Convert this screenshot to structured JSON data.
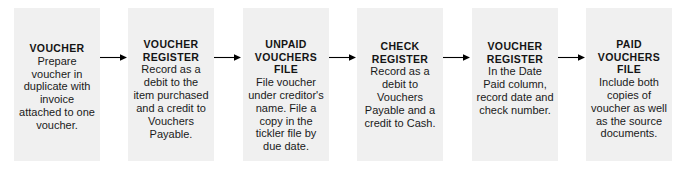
{
  "diagram": {
    "box_color": "#f0f0f0",
    "arrow_color": "#000000",
    "text_color": "#141414",
    "nodes": [
      {
        "id": "voucher",
        "title": "VOUCHER",
        "body": "Prepare voucher in duplicate with invoice attached to one voucher."
      },
      {
        "id": "voucher-register-1",
        "title": "VOUCHER REGISTER",
        "body": "Record as a debit to the item purchased and a credit to Vouchers Payable."
      },
      {
        "id": "unpaid-vouchers-file",
        "title": "UNPAID VOUCHERS FILE",
        "body": "File voucher under creditor's name. File a copy in the tickler file by due date."
      },
      {
        "id": "check-register",
        "title": "CHECK REGISTER",
        "body": "Record as a debit to Vouchers Payable and a credit to Cash."
      },
      {
        "id": "voucher-register-2",
        "title": "VOUCHER REGISTER",
        "body": "In the Date Paid column, record date and check number."
      },
      {
        "id": "paid-vouchers-file",
        "title": "PAID VOUCHERS FILE",
        "body": "Include both copies of voucher as well as the source documents."
      }
    ],
    "connectors": [
      {
        "id": "arrow-1",
        "from": "voucher",
        "to": "voucher-register-1",
        "icon": "arrow-right-icon"
      },
      {
        "id": "arrow-2",
        "from": "voucher-register-1",
        "to": "unpaid-vouchers-file",
        "icon": "arrow-right-icon"
      },
      {
        "id": "arrow-3",
        "from": "unpaid-vouchers-file",
        "to": "check-register",
        "icon": "arrow-right-icon"
      },
      {
        "id": "arrow-4",
        "from": "check-register",
        "to": "voucher-register-2",
        "icon": "arrow-right-icon"
      },
      {
        "id": "arrow-5",
        "from": "voucher-register-2",
        "to": "paid-vouchers-file",
        "icon": "arrow-right-icon"
      }
    ]
  }
}
